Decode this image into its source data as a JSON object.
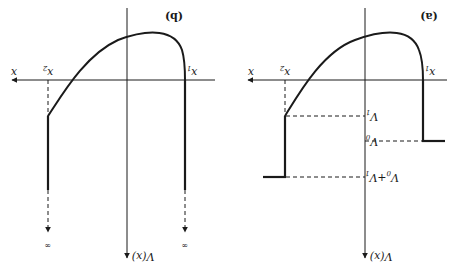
{
  "figure": {
    "orientation": "rotated-180",
    "panels": [
      {
        "id": "a",
        "label": "(a)",
        "x_axis_label": "x",
        "y_axis_label": "V(x)",
        "points": {
          "x1": "x1",
          "x2": "x2"
        },
        "levels": [
          "V1",
          "V0",
          "V0+V1"
        ],
        "description": "Finite potential well: left wall at x2 steps to V0+V1, right wall at x1 steps to V0; dashed guides at V1, V0, V0+V1"
      },
      {
        "id": "b",
        "label": "(b)",
        "x_axis_label": "x",
        "y_axis_label": "V(x)",
        "points": {
          "x1": "x1",
          "x2": "x2"
        },
        "infinity_labels": [
          "∞",
          "∞"
        ],
        "description": "Infinite potential well: walls at x1 and x2 extend to infinity (dashed arrows)"
      }
    ]
  },
  "labels": {
    "a_tag": "(a)",
    "b_tag": "(b)",
    "x": "x",
    "x1": "x",
    "x2": "x",
    "sub1": "1",
    "sub2": "2",
    "Vx": "V(x)",
    "V1": "V",
    "V0": "V",
    "V0V1": "V",
    "V0V1_mid": "+V",
    "sub0": "0",
    "inf": "∞"
  }
}
